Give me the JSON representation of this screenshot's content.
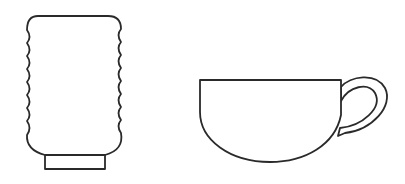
{
  "figure": {
    "items": [
      {
        "name": "tumbler",
        "shape": "wavy-sided cup with rectangular base"
      },
      {
        "name": "teacup",
        "shape": "half-round bowl with loop handle"
      }
    ]
  },
  "colors": {
    "background": "#ffffff",
    "stroke": "#2a2a2a",
    "fill": "#ffffff"
  }
}
